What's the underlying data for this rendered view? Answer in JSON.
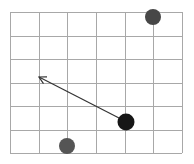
{
  "board": {
    "origin": {
      "x": 10,
      "y": 12
    },
    "cols": 6,
    "rows": 6,
    "cell_w": 28.67,
    "cell_h": 23.5,
    "grid_color": "#a8a8a8",
    "grid_width": 1
  },
  "pieces": [
    {
      "name": "gray-dot-top-right",
      "cx": 153,
      "cy": 17,
      "r": 8,
      "color": "#474747"
    },
    {
      "name": "black-dot-agent",
      "cx": 126,
      "cy": 122,
      "r": 8.5,
      "color": "#161616"
    },
    {
      "name": "gray-dot-bottom",
      "cx": 67,
      "cy": 146,
      "r": 8,
      "color": "#555555"
    }
  ],
  "arrow": {
    "from": {
      "x": 119,
      "y": 118
    },
    "to": {
      "x": 39,
      "y": 77
    },
    "color": "#333333",
    "width": 1.2,
    "head_len": 8
  }
}
